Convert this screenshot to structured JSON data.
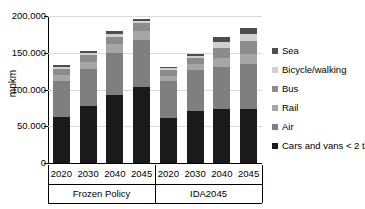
{
  "chart_data": {
    "type": "bar",
    "subtype": "stacked-bar-grouped",
    "title": "",
    "xlabel": "",
    "ylabel": "mpkm",
    "ylim": [
      0,
      200000
    ],
    "ytick_labels": [
      "0",
      "50.000",
      "100.000",
      "150.000",
      "200.000"
    ],
    "ytick_values": [
      0,
      50000,
      100000,
      150000,
      200000
    ],
    "grid": true,
    "legend_position": "right",
    "groups": [
      "Frozen Policy",
      "IDA2045"
    ],
    "categories": [
      "2020",
      "2030",
      "2040",
      "2045",
      "2020",
      "2030",
      "2040",
      "2045"
    ],
    "stack_order_bottom_to_top": [
      "Cars and vans < 2 t",
      "Air",
      "Rail",
      "Bus",
      "Bicycle/walking",
      "Sea"
    ],
    "series": [
      {
        "name": "Cars and vans < 2 t",
        "color": "#1a1a1a",
        "values": [
          63000,
          77000,
          93000,
          103000,
          61000,
          71000,
          73000,
          74000
        ]
      },
      {
        "name": "Air",
        "color": "#7f7f7f",
        "values": [
          49000,
          51000,
          57000,
          64000,
          50000,
          56000,
          58000,
          61000
        ]
      },
      {
        "name": "Rail",
        "color": "#a6a6a6",
        "values": [
          8000,
          10000,
          12000,
          13000,
          7000,
          8000,
          12000,
          13000
        ]
      },
      {
        "name": "Bus",
        "color": "#8c8c8c",
        "values": [
          8000,
          9000,
          10000,
          10000,
          8000,
          8000,
          13000,
          18000
        ]
      },
      {
        "name": "Bicycle/walking",
        "color": "#d0d0d0",
        "values": [
          3000,
          3000,
          4000,
          3000,
          3000,
          3000,
          8000,
          10000
        ]
      },
      {
        "name": "Sea",
        "color": "#4d4d4d",
        "values": [
          2000,
          3000,
          3000,
          3000,
          2000,
          3000,
          7000,
          8000
        ]
      }
    ],
    "totals": [
      133000,
      153000,
      179000,
      196000,
      131000,
      149000,
      171000,
      184000
    ],
    "legend_entries": [
      {
        "label": "Sea",
        "color": "#4d4d4d"
      },
      {
        "label": "Bicycle/walking",
        "color": "#d0d0d0"
      },
      {
        "label": "Bus",
        "color": "#8c8c8c"
      },
      {
        "label": "Rail",
        "color": "#a6a6a6"
      },
      {
        "label": "Air",
        "color": "#7f7f7f"
      },
      {
        "label": "Cars and vans < 2 t",
        "color": "#1a1a1a"
      }
    ]
  }
}
